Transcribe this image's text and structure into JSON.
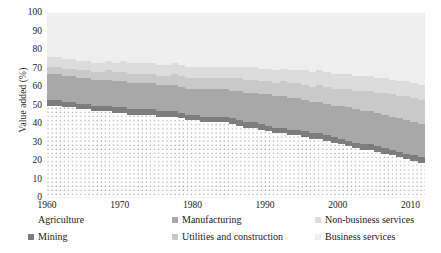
{
  "chart_data": {
    "type": "area",
    "stacked": true,
    "title": "",
    "xlabel": "",
    "ylabel": "Value added (%)",
    "xlim": [
      1960,
      2012
    ],
    "ylim": [
      0,
      100
    ],
    "yticks": [
      0,
      10,
      20,
      30,
      40,
      50,
      60,
      70,
      80,
      90,
      100
    ],
    "xticks": [
      1960,
      1970,
      1980,
      1990,
      2000,
      2010
    ],
    "grid": false,
    "legend_position": "bottom",
    "x": [
      1960,
      1961,
      1962,
      1963,
      1964,
      1965,
      1966,
      1967,
      1968,
      1969,
      1970,
      1971,
      1972,
      1973,
      1974,
      1975,
      1976,
      1977,
      1978,
      1979,
      1980,
      1981,
      1982,
      1983,
      1984,
      1985,
      1986,
      1987,
      1988,
      1989,
      1990,
      1991,
      1992,
      1993,
      1994,
      1995,
      1996,
      1997,
      1998,
      1999,
      2000,
      2001,
      2002,
      2003,
      2004,
      2005,
      2006,
      2007,
      2008,
      2009,
      2010,
      2011,
      2012
    ],
    "series": [
      {
        "name": "Agriculture",
        "color": "#ffffff",
        "pattern": "dots",
        "values": [
          50,
          50,
          49,
          49,
          48,
          48,
          47,
          47,
          47,
          46,
          46,
          45,
          45,
          45,
          45,
          44,
          44,
          44,
          43,
          42,
          42,
          41,
          41,
          41,
          41,
          40,
          39,
          38,
          38,
          37,
          36,
          35,
          35,
          34,
          34,
          33,
          32,
          32,
          31,
          30,
          29,
          28,
          27,
          26,
          26,
          25,
          24,
          23,
          22,
          21,
          20,
          19,
          18
        ]
      },
      {
        "name": "Mining",
        "color": "#7d7d7d",
        "pattern": "solid",
        "values": [
          3,
          3,
          3,
          3,
          3,
          3,
          3,
          3,
          3,
          3,
          3,
          3,
          3,
          3,
          3,
          3,
          3,
          3,
          3,
          3,
          3,
          3,
          3,
          3,
          3,
          3,
          3,
          3,
          3,
          3,
          3,
          3,
          3,
          3,
          3,
          3,
          3,
          3,
          3,
          3,
          3,
          3,
          3,
          3,
          3,
          3,
          3,
          3,
          3,
          3,
          3,
          3,
          3
        ]
      },
      {
        "name": "Manufacturing",
        "color": "#a8a8a8",
        "pattern": "solid",
        "values": [
          14,
          14,
          14,
          14,
          14,
          14,
          14,
          14,
          14,
          14,
          14,
          14,
          14,
          14,
          14,
          14,
          14,
          14,
          14,
          14,
          14,
          15,
          15,
          15,
          15,
          15,
          16,
          16,
          16,
          16,
          17,
          17,
          17,
          17,
          17,
          17,
          17,
          17,
          17,
          17,
          18,
          18,
          18,
          18,
          18,
          18,
          18,
          18,
          18,
          18,
          18,
          18,
          18
        ]
      },
      {
        "name": "Utilities and construction",
        "color": "#c9c9c9",
        "pattern": "solid",
        "values": [
          4,
          4,
          4,
          4,
          4,
          4,
          4,
          4,
          5,
          5,
          5,
          5,
          5,
          5,
          5,
          5,
          5,
          6,
          6,
          6,
          6,
          6,
          6,
          6,
          6,
          7,
          7,
          7,
          7,
          7,
          7,
          7,
          8,
          8,
          8,
          8,
          8,
          9,
          9,
          9,
          9,
          10,
          10,
          11,
          11,
          11,
          12,
          12,
          12,
          13,
          13,
          13,
          14
        ]
      },
      {
        "name": "Non-business services",
        "color": "#dcdcdc",
        "pattern": "solid",
        "values": [
          5,
          5,
          5,
          5,
          5,
          5,
          5,
          5,
          5,
          5,
          6,
          6,
          6,
          6,
          6,
          6,
          6,
          6,
          6,
          6,
          6,
          6,
          6,
          6,
          6,
          6,
          6,
          7,
          7,
          7,
          7,
          7,
          7,
          7,
          7,
          8,
          8,
          8,
          8,
          8,
          8,
          8,
          8,
          8,
          8,
          8,
          8,
          8,
          8,
          8,
          8,
          8,
          8
        ]
      },
      {
        "name": "Business services",
        "color": "#efefef",
        "pattern": "solid",
        "values": [
          24,
          24,
          25,
          25,
          26,
          26,
          27,
          27,
          26,
          27,
          26,
          27,
          27,
          27,
          27,
          28,
          28,
          27,
          29,
          30,
          29,
          29,
          29,
          29,
          29,
          29,
          29,
          29,
          29,
          30,
          30,
          31,
          30,
          31,
          31,
          31,
          32,
          31,
          32,
          33,
          33,
          33,
          34,
          34,
          34,
          35,
          35,
          36,
          37,
          37,
          38,
          39,
          39
        ]
      }
    ]
  },
  "axes": {
    "y_title": "Value added (%)",
    "y_tick_labels": [
      "100",
      "90",
      "80",
      "70",
      "60",
      "50",
      "40",
      "30",
      "20",
      "10",
      "0"
    ],
    "x_tick_labels": [
      "1960",
      "1970",
      "1980",
      "1990",
      "2000",
      "2010"
    ]
  },
  "legend": {
    "items": [
      {
        "label": "Agriculture",
        "swatch": "dots",
        "color": "#ffffff"
      },
      {
        "label": "Mining",
        "swatch": "solid",
        "color": "#7d7d7d"
      },
      {
        "label": "Manufacturing",
        "swatch": "solid",
        "color": "#a8a8a8"
      },
      {
        "label": "Utilities and construction",
        "swatch": "solid",
        "color": "#c9c9c9"
      },
      {
        "label": "Non-business services",
        "swatch": "solid",
        "color": "#dcdcdc"
      },
      {
        "label": "Business services",
        "swatch": "solid",
        "color": "#efefef"
      }
    ]
  }
}
